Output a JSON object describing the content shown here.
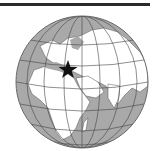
{
  "map": {
    "type": "orthographic locator globe",
    "region_shown": "Europe, Africa, Middle East, Asia",
    "marker": {
      "symbol": "star",
      "location_label": "Turkey / Syria region",
      "color": "#111111"
    },
    "colors": {
      "ocean": "#a8a8a8",
      "land": "#ffffff",
      "borders": "#555555",
      "graticule": "#444444",
      "rule": "#2a2a2a"
    }
  }
}
